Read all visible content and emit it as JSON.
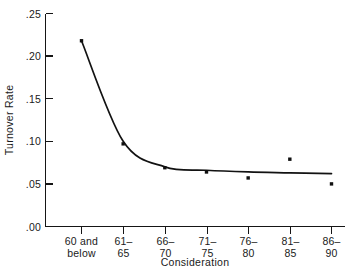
{
  "chart_data": {
    "type": "line",
    "title": "",
    "subtitle": "",
    "xlabel": "Consideration",
    "ylabel": "Turnover Rate",
    "categories": [
      "60 and below",
      "61-65",
      "66-70",
      "71-75",
      "76-80",
      "81-85",
      "86-90"
    ],
    "category_lines": [
      [
        "60 and",
        "below"
      ],
      [
        "61–",
        "65"
      ],
      [
        "66–",
        "70"
      ],
      [
        "71–",
        "75"
      ],
      [
        "76–",
        "80"
      ],
      [
        "81–",
        "85"
      ],
      [
        "86–",
        "90"
      ]
    ],
    "values": [
      0.218,
      0.097,
      0.069,
      0.064,
      0.057,
      0.079,
      0.05
    ],
    "fitted_curve": [
      0.218,
      0.1,
      0.07,
      0.066,
      0.064,
      0.063,
      0.062
    ],
    "ylim": [
      0.0,
      0.25
    ],
    "yticks": [
      0.0,
      0.05,
      0.1,
      0.15,
      0.2,
      0.25
    ],
    "ytick_labels": [
      ".00",
      ".05",
      ".10",
      ".15",
      ".20",
      ".25"
    ],
    "grid": false,
    "legend": false,
    "legend_position": "none",
    "marker": "square",
    "series": [
      {
        "name": "Turnover Rate",
        "values": [
          0.218,
          0.097,
          0.069,
          0.064,
          0.057,
          0.079,
          0.05
        ]
      }
    ],
    "colors": {
      "line": "#121212",
      "marker": "#101010",
      "axis": "#151515",
      "background": "#ffffff"
    }
  },
  "axes": {
    "y_title": "Turnover Rate",
    "x_title": "Consideration"
  }
}
